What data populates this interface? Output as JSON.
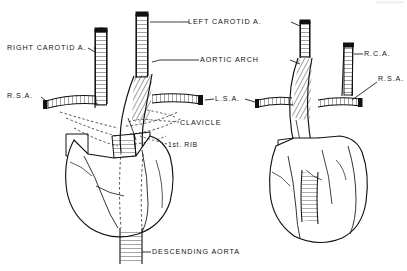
{
  "document": {
    "type": "anatomical-line-drawing",
    "title": "Aortic Arch and Great Vessels",
    "background_color": "#ffffff",
    "ink_color": "#111111",
    "views": [
      {
        "name": "left-figure",
        "description": "Normal left aortic arch"
      },
      {
        "name": "right-figure",
        "description": "Right aortic arch variant"
      }
    ]
  },
  "labels": {
    "right_carotid": "RIGHT CAROTID A.",
    "rsa_left": "R.S.A.",
    "left_carotid": "LEFT CAROTID A.",
    "aortic_arch": "AORTIC ARCH",
    "lsa": "L.S.A.",
    "clavicle": "CLAVICLE",
    "first_rib": "1st. RIB",
    "descending_aorta": "DESCENDING AORTA",
    "rca": "R.C.A.",
    "rsa_right": "R.S.A."
  }
}
